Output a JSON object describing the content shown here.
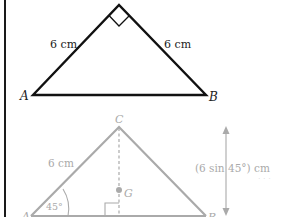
{
  "figure_top": {
    "vertex_a": "A",
    "vertex_b": "B",
    "side_left": "6 cm",
    "side_right": "6 cm",
    "right_angle_at": "apex",
    "stroke_color": "#111111"
  },
  "figure_bottom": {
    "vertex_a": "A",
    "vertex_b": "B",
    "vertex_c": "C",
    "centroid": "G",
    "side_left": "6 cm",
    "angle_a": "45°",
    "height_label": "(6 sin 45°) cm",
    "stroke_color": "#aaaaaa"
  }
}
